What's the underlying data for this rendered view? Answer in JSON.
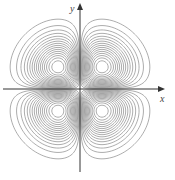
{
  "chart_data": {
    "type": "contour",
    "title": "",
    "function": "f(x, y) = x·y·e^(-(x²+y²))",
    "xlabel": "x",
    "ylabel": "y",
    "grid": false,
    "legend": null,
    "xlim": [
      -2.6,
      2.6
    ],
    "ylim": [
      -2.6,
      2.6
    ],
    "lobes": [
      {
        "quadrant": "I",
        "center": [
          0.71,
          0.71
        ]
      },
      {
        "quadrant": "II",
        "center": [
          -0.71,
          0.71
        ]
      },
      {
        "quadrant": "III",
        "center": [
          -0.71,
          -0.71
        ]
      },
      {
        "quadrant": "IV",
        "center": [
          0.71,
          -0.71
        ]
      }
    ],
    "contour_levels_per_lobe": 16,
    "line_color": "#8a8a8a",
    "axis_color": "#333333"
  },
  "axes": {
    "x_label": "x",
    "y_label": "y"
  }
}
